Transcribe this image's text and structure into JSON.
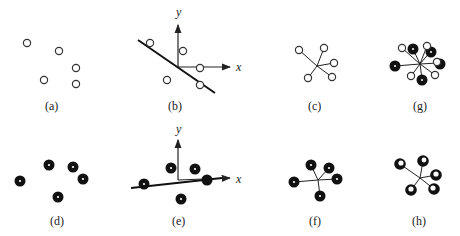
{
  "figure": {
    "panels": [
      {
        "id": "a",
        "label": "(a)"
      },
      {
        "id": "b",
        "label": "(b)",
        "axis_x": "x",
        "axis_y": "y"
      },
      {
        "id": "c",
        "label": "(c)"
      },
      {
        "id": "g",
        "label": "(g)"
      },
      {
        "id": "d",
        "label": "(d)"
      },
      {
        "id": "e",
        "label": "(e)",
        "axis_x": "x",
        "axis_y": "y"
      },
      {
        "id": "f",
        "label": "(f)"
      },
      {
        "id": "h",
        "label": "(h)"
      }
    ]
  },
  "colors": {
    "stroke": "#222222",
    "fill_dark": "#111111",
    "fill_light": "#ffffff"
  }
}
